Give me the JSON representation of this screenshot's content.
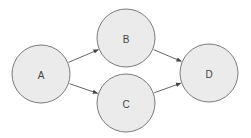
{
  "diagram": {
    "type": "directed-graph",
    "nodes": [
      {
        "id": "A",
        "label": "A",
        "cx": 41,
        "cy": 74,
        "r": 29
      },
      {
        "id": "B",
        "label": "B",
        "cx": 126,
        "cy": 38,
        "r": 29
      },
      {
        "id": "C",
        "label": "C",
        "cx": 126,
        "cy": 103,
        "r": 29
      },
      {
        "id": "D",
        "label": "D",
        "cx": 209,
        "cy": 73,
        "r": 29
      }
    ],
    "edges": [
      {
        "from": "A",
        "to": "B"
      },
      {
        "from": "A",
        "to": "C"
      },
      {
        "from": "B",
        "to": "D"
      },
      {
        "from": "C",
        "to": "D"
      }
    ],
    "colors": {
      "node_fill": "#ebebeb",
      "node_stroke": "#7a7a7a",
      "edge": "#555555",
      "label": "#444444"
    }
  }
}
